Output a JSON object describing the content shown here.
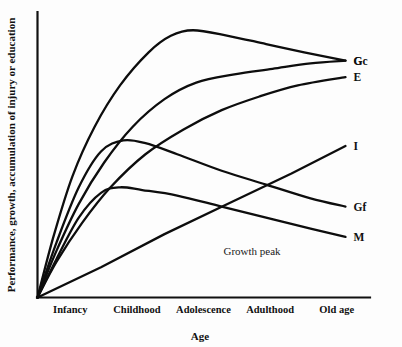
{
  "chart_data": {
    "type": "line",
    "title": "",
    "xlabel": "Age",
    "ylabel": "Performance, growth, accumulation of injury or education",
    "categories": [
      "Infancy",
      "Childhood",
      "Adolescence",
      "Adulthood",
      "Old age"
    ],
    "grid": false,
    "legend_position": "right-inline-labels",
    "xlim": [
      0,
      5
    ],
    "ylim": [
      0,
      100
    ],
    "annotations": [
      {
        "text": "Growth peak",
        "x": 2.95,
        "y": 22
      }
    ],
    "series": [
      {
        "name": "G",
        "label": "G",
        "description": "General cognitive ability: steep rise through childhood, peak in adolescence, slow decline",
        "x": [
          0.0,
          0.25,
          0.55,
          0.9,
          1.3,
          1.75,
          2.1,
          2.45,
          3.0,
          3.6,
          4.2,
          4.85
        ],
        "values": [
          0,
          22,
          44,
          62,
          77,
          89,
          95,
          97,
          95,
          92,
          89,
          86
        ]
      },
      {
        "name": "Gc",
        "label": "Gc",
        "description": "Crystallized intelligence: rises and asymptotes high into old age",
        "x": [
          0.0,
          0.3,
          0.65,
          1.05,
          1.5,
          2.0,
          2.5,
          3.1,
          3.7,
          4.3,
          4.85
        ],
        "values": [
          0,
          17,
          34,
          49,
          62,
          72,
          78,
          81,
          83,
          85,
          86
        ]
      },
      {
        "name": "E",
        "label": "E",
        "description": "Education / accumulated learning: steady near-linear increase across the lifespan",
        "x": [
          0.0,
          0.3,
          0.7,
          1.15,
          1.7,
          2.3,
          2.9,
          3.5,
          4.1,
          4.85
        ],
        "values": [
          0,
          13,
          27,
          40,
          52,
          61,
          68,
          73,
          77,
          80
        ]
      },
      {
        "name": "I",
        "label": "I",
        "description": "Accumulation of injury: straight linear rise from infancy to old age",
        "x": [
          0.0,
          1.0,
          2.0,
          3.0,
          4.0,
          4.85
        ],
        "values": [
          0,
          11,
          23,
          34,
          45,
          55
        ]
      },
      {
        "name": "Gf",
        "label": "Gf",
        "description": "Fluid intelligence: early peak in adolescence followed by steady decline",
        "x": [
          0.0,
          0.3,
          0.65,
          1.0,
          1.35,
          1.7,
          2.2,
          2.9,
          3.6,
          4.3,
          4.85
        ],
        "values": [
          0,
          20,
          40,
          53,
          57,
          56,
          52,
          46,
          41,
          36,
          33
        ]
      },
      {
        "name": "M",
        "label": "M",
        "description": "Memory / processing speed: modest early peak then gradual decline",
        "x": [
          0.0,
          0.3,
          0.65,
          1.0,
          1.3,
          1.65,
          2.2,
          2.9,
          3.6,
          4.3,
          4.85
        ],
        "values": [
          0,
          14,
          29,
          38,
          40,
          39,
          37,
          33,
          29,
          25,
          22
        ]
      }
    ]
  },
  "axes": {
    "y_title": "Performance, growth, accumulation of injury or education",
    "x_title": "Age",
    "x_ticks": [
      "Infancy",
      "Childhood",
      "Adolescence",
      "Adulthood",
      "Old age"
    ]
  },
  "annotations": {
    "growth_peak": "Growth peak"
  },
  "series_labels": {
    "g": "G",
    "gc": "Gc",
    "e": "E",
    "i": "I",
    "gf": "Gf",
    "m": "M"
  },
  "colors": {
    "background": "#fdfdfd",
    "ink": "#111111",
    "curve": "#0d0d0d"
  }
}
